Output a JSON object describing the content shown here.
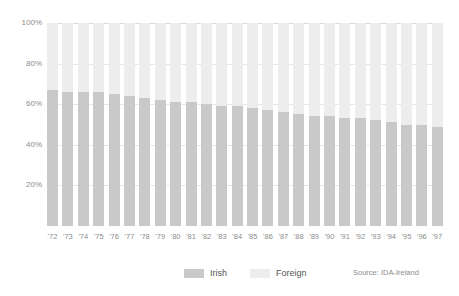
{
  "chart_data": {
    "type": "bar",
    "subtype": "stacked-100-percent",
    "title": "",
    "xlabel": "",
    "ylabel": "",
    "ylim": [
      0,
      100
    ],
    "ytick_labels": [
      "100%",
      "80%",
      "60%",
      "40%",
      "20%"
    ],
    "ytick_values": [
      100,
      80,
      60,
      40,
      20
    ],
    "grid": true,
    "legend_position": "bottom-center",
    "categories": [
      "'72",
      "'73",
      "'74",
      "'75",
      "'76",
      "'77",
      "'78",
      "'79",
      "'80",
      "'81",
      "'82",
      "'83",
      "'84",
      "'85",
      "'86",
      "'87",
      "'88",
      "'89",
      "'90",
      "'91",
      "'92",
      "'93",
      "'94",
      "'95",
      "'96",
      "'97"
    ],
    "series": [
      {
        "name": "Irish",
        "color": "#c9c9c9",
        "values": [
          67,
          66,
          66,
          66,
          65,
          64,
          63,
          62,
          61,
          61,
          60,
          59,
          59,
          58,
          57,
          56,
          55,
          54,
          54,
          53,
          53,
          52,
          51,
          50,
          50,
          49
        ]
      },
      {
        "name": "Foreign",
        "color": "#ededed",
        "values": [
          33,
          34,
          34,
          34,
          35,
          36,
          37,
          38,
          39,
          39,
          40,
          41,
          41,
          42,
          43,
          44,
          45,
          46,
          46,
          47,
          47,
          48,
          49,
          50,
          50,
          51
        ]
      }
    ],
    "annotations": [
      "Source: IDA-Ireland"
    ]
  },
  "legend": {
    "entries": [
      {
        "label": "Irish",
        "color": "#c9c9c9"
      },
      {
        "label": "Foreign",
        "color": "#ededed"
      }
    ]
  },
  "source": {
    "text": "Source: IDA-Ireland"
  },
  "colors": {
    "irish": "#c9c9c9",
    "foreign": "#ededed",
    "grid": "#e6e6e6",
    "text": "#8d8d8d",
    "background": "#ffffff"
  }
}
